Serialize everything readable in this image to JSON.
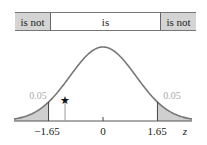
{
  "region_bar": {
    "left_label": "is not",
    "middle_label": "is",
    "right_label": "is not"
  },
  "axis": {
    "variable": "z",
    "ticks": [
      {
        "value": -1.65,
        "label": "−1.65"
      },
      {
        "value": 0,
        "label": "0"
      },
      {
        "value": 1.65,
        "label": "1.65"
      }
    ]
  },
  "tails": {
    "left_area": "0.05",
    "right_area": "0.05"
  },
  "marker": {
    "symbol": "star",
    "z_position": -1.15
  },
  "colors": {
    "shade": "#cfcfcf",
    "curve": "#777777",
    "area_label": "#aaaaaa"
  },
  "chart_data": {
    "type": "area",
    "title": "",
    "xlabel": "z",
    "ylabel": "",
    "distribution": "standard normal",
    "critical_values": [
      -1.65,
      1.65
    ],
    "tail_areas": [
      0.05,
      0.05
    ],
    "region_labels": [
      "is not",
      "is",
      "is not"
    ],
    "marker_z": -1.15,
    "x_ticks": [
      -1.65,
      0,
      1.65
    ],
    "xlim": [
      -2.7,
      2.7
    ]
  }
}
